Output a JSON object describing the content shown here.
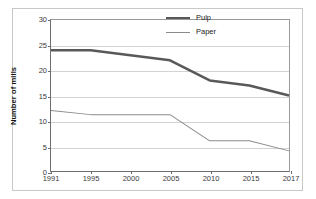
{
  "chart_data": {
    "type": "line",
    "title": "",
    "subtitle": "",
    "xlabel": "",
    "ylabel": "Number of mills",
    "categories": [
      "1991",
      "1995",
      "2000",
      "2005",
      "2010",
      "2015",
      "2017"
    ],
    "x": [
      1991,
      1995,
      2000,
      2005,
      2010,
      2015,
      2017
    ],
    "series": [
      {
        "name": "Pulp",
        "values": [
          24,
          24,
          23,
          22,
          18,
          17,
          15
        ],
        "color": "#595959",
        "line_width": 2.5
      },
      {
        "name": "Paper",
        "values": [
          12,
          11.2,
          11.2,
          11.2,
          6,
          6,
          4
        ],
        "color": "#8a8a8a",
        "line_width": 1
      }
    ],
    "ylim": [
      0,
      30
    ],
    "yticks": [
      0,
      5,
      10,
      15,
      20,
      25,
      30
    ],
    "ytick_labels": [
      "0",
      "5",
      "10",
      "15",
      "20",
      "25",
      "30"
    ],
    "grid": true,
    "grid_axis": "y",
    "legend_position": "top-right",
    "legend_entries": [
      "Pulp",
      "Paper"
    ]
  },
  "colors": {
    "background": "#ffffff",
    "frame": "#c8c8c8",
    "axis": "#6e6e6e",
    "gridline": "#d3d3d3",
    "pulp": "#595959",
    "paper": "#8a8a8a",
    "tick_text": "#3a3a3a",
    "label_text": "#111111"
  }
}
